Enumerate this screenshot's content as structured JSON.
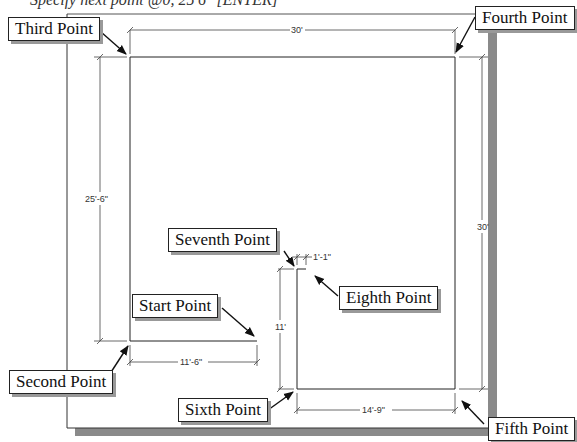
{
  "prompt": {
    "text": "Specify next point @0, 25'6\" [ENTER]"
  },
  "callouts": {
    "start": "Start Point",
    "second": "Second Point",
    "third": "Third Point",
    "fourth": "Fourth Point",
    "fifth": "Fifth Point",
    "sixth": "Sixth Point",
    "seventh": "Seventh Point",
    "eighth": "Eighth Point"
  },
  "dimensions": {
    "top_width": "30'",
    "left_height": "25'-6\"",
    "right_height": "30'",
    "start_segment": "11'-6\"",
    "inner_height": "11'",
    "gap": "1'-1\"",
    "bottom_segment": "14'-9\""
  },
  "colors": {
    "line": "#222222",
    "dim_line": "#444444",
    "shadow": "#8a8a8a",
    "callout_bg": "#ffffff"
  }
}
